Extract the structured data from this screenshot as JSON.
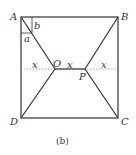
{
  "figure": {
    "caption": "(b)",
    "vertices": {
      "A": "A",
      "B": "B",
      "C": "C",
      "D": "D",
      "O": "O",
      "P": "P"
    },
    "angle_labels": {
      "a": "a",
      "b": "b"
    },
    "segment_labels": [
      "x",
      "x",
      "x"
    ],
    "line_color": "#333333",
    "dashed_color": "#999999"
  }
}
